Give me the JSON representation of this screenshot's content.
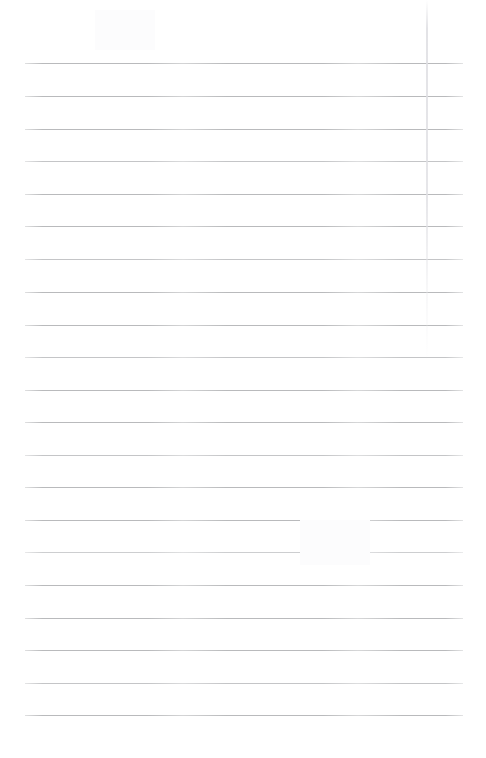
{
  "document": {
    "kind": "scanned-blank-ruled-page",
    "title": "Blank lined notebook page",
    "page_background_color": "#ffffff",
    "rule_color": "#b9babc",
    "body_text": "",
    "page_width": 486,
    "page_height": 758,
    "ruling": {
      "line_count": 21,
      "first_line_y": 63,
      "line_spacing": 32.6,
      "line_left_x": 25,
      "line_right_x": 463,
      "line_thickness": 1
    },
    "artifact": {
      "name": "vertical-scan-streak",
      "x": 426,
      "top": 0,
      "height": 360,
      "color": "#e2e2e6"
    },
    "lines": [
      {
        "index": 1,
        "y": 63,
        "weight": "normal",
        "text": ""
      },
      {
        "index": 2,
        "y": 96,
        "weight": "normal",
        "text": ""
      },
      {
        "index": 3,
        "y": 129,
        "weight": "normal",
        "text": ""
      },
      {
        "index": 4,
        "y": 161,
        "weight": "soft",
        "text": ""
      },
      {
        "index": 5,
        "y": 194,
        "weight": "normal",
        "text": ""
      },
      {
        "index": 6,
        "y": 226,
        "weight": "normal",
        "text": ""
      },
      {
        "index": 7,
        "y": 259,
        "weight": "soft",
        "text": ""
      },
      {
        "index": 8,
        "y": 292,
        "weight": "normal",
        "text": ""
      },
      {
        "index": 9,
        "y": 325,
        "weight": "normal",
        "text": ""
      },
      {
        "index": 10,
        "y": 357,
        "weight": "soft",
        "text": ""
      },
      {
        "index": 11,
        "y": 390,
        "weight": "normal",
        "text": ""
      },
      {
        "index": 12,
        "y": 422,
        "weight": "normal",
        "text": ""
      },
      {
        "index": 13,
        "y": 455,
        "weight": "soft",
        "text": ""
      },
      {
        "index": 14,
        "y": 487,
        "weight": "normal",
        "text": ""
      },
      {
        "index": 15,
        "y": 520,
        "weight": "normal",
        "text": ""
      },
      {
        "index": 16,
        "y": 552,
        "weight": "softer",
        "text": ""
      },
      {
        "index": 17,
        "y": 585,
        "weight": "normal",
        "text": ""
      },
      {
        "index": 18,
        "y": 618,
        "weight": "normal",
        "text": ""
      },
      {
        "index": 19,
        "y": 650,
        "weight": "normal",
        "text": ""
      },
      {
        "index": 20,
        "y": 683,
        "weight": "soft",
        "text": ""
      },
      {
        "index": 21,
        "y": 715,
        "weight": "normal",
        "text": ""
      }
    ]
  }
}
